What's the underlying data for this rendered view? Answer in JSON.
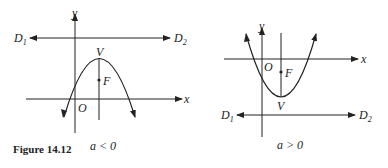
{
  "figure": {
    "caption": "Figure 14.12",
    "left": {
      "condition": "a < 0",
      "labels": {
        "y": "y",
        "x": "x",
        "origin": "O",
        "vertex": "V",
        "focus": "F",
        "d1": "D",
        "d1_sub": "1",
        "d2": "D",
        "d2_sub": "2"
      }
    },
    "right": {
      "condition": "a > 0",
      "labels": {
        "y": "y",
        "x": "x",
        "origin": "O",
        "vertex": "V",
        "focus": "F",
        "d1": "D",
        "d1_sub": "1",
        "d2": "D",
        "d2_sub": "2"
      }
    }
  },
  "colors": {
    "ink": "#222222",
    "background": "#ffffff"
  }
}
